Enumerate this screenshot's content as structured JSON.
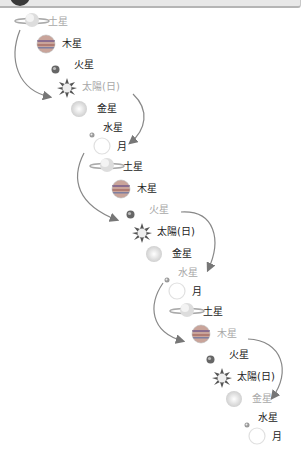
{
  "header": {
    "bar": "decorative-header"
  },
  "diagram": {
    "colors": {
      "label": "#222222",
      "faded_label": "#a8a8a8",
      "arrow": "#777777"
    },
    "cycles": [
      {
        "items": [
          {
            "label": "土星",
            "icon": "saturn-icon",
            "faded": true
          },
          {
            "label": "木星",
            "icon": "jupiter-icon",
            "faded": false
          },
          {
            "label": "火星",
            "icon": "mars-icon",
            "faded": false
          },
          {
            "label": "太陽(日)",
            "icon": "sun-icon",
            "faded": true
          },
          {
            "label": "金星",
            "icon": "venus-icon",
            "faded": false
          },
          {
            "label": "水星",
            "icon": "mercury-icon",
            "faded": false
          },
          {
            "label": "月",
            "icon": "moon-icon",
            "faded": false
          }
        ]
      },
      {
        "items": [
          {
            "label": "土星",
            "icon": "saturn-icon",
            "faded": false
          },
          {
            "label": "木星",
            "icon": "jupiter-icon",
            "faded": false
          },
          {
            "label": "火星",
            "icon": "mars-icon",
            "faded": true
          },
          {
            "label": "太陽(日)",
            "icon": "sun-icon",
            "faded": false
          },
          {
            "label": "金星",
            "icon": "venus-icon",
            "faded": false
          },
          {
            "label": "水星",
            "icon": "mercury-icon",
            "faded": true
          },
          {
            "label": "月",
            "icon": "moon-icon",
            "faded": false
          }
        ]
      },
      {
        "items": [
          {
            "label": "土星",
            "icon": "saturn-icon",
            "faded": false
          },
          {
            "label": "木星",
            "icon": "jupiter-icon",
            "faded": true
          },
          {
            "label": "火星",
            "icon": "mars-icon",
            "faded": false
          },
          {
            "label": "太陽(日)",
            "icon": "sun-icon",
            "faded": false
          },
          {
            "label": "金星",
            "icon": "venus-icon",
            "faded": true
          },
          {
            "label": "水星",
            "icon": "mercury-icon",
            "faded": false
          },
          {
            "label": "月",
            "icon": "moon-icon",
            "faded": false
          }
        ]
      }
    ]
  }
}
